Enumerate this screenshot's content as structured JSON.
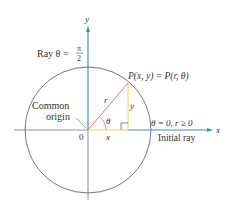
{
  "figure": {
    "labels": {
      "y_axis": "y",
      "x_axis": "x",
      "ray_prefix": "Ray θ =",
      "ray_num": "π",
      "ray_den": "2",
      "point": "P(x, y) = P(r, θ)",
      "r": "r",
      "y_leg": "y",
      "x_leg": "x",
      "theta": "θ",
      "origin_num": "0",
      "common": "Common",
      "origin_word": "origin",
      "initial_condition": "θ = 0, r ≥ 0",
      "initial_ray": "Initial ray"
    },
    "colors": {
      "ray": "#3b8fd0",
      "radius": "#e8707a",
      "legs": "#f0d040",
      "circle": "#555555",
      "axis": "#777777"
    }
  }
}
